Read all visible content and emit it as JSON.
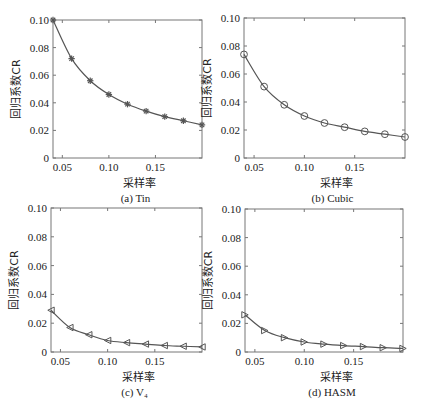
{
  "figure": {
    "panels": [
      {
        "id": "a",
        "caption": "(a) Tin",
        "box": {
          "x0": 53,
          "y0": 20,
          "x1": 202,
          "y1": 158
        },
        "marker": "star"
      },
      {
        "id": "b",
        "caption": "(b) Cubic",
        "box": {
          "x0": 244,
          "y0": 18,
          "x1": 405,
          "y1": 158
        },
        "marker": "circle"
      },
      {
        "id": "c",
        "caption": "(c) V₄",
        "box": {
          "x0": 51,
          "y0": 208,
          "x1": 202,
          "y1": 352
        },
        "marker": "triangle-left"
      },
      {
        "id": "d",
        "caption": "(d) HASM",
        "box": {
          "x0": 245,
          "y0": 209,
          "x1": 403,
          "y1": 352
        },
        "marker": "triangle-right"
      }
    ],
    "line_color": "#555555",
    "marker_color": "#555555"
  },
  "chart_data": [
    {
      "type": "line",
      "title": "(a) Tin",
      "xlabel": "采样率",
      "ylabel": "回归系数CR",
      "x": [
        0.04,
        0.06,
        0.08,
        0.1,
        0.12,
        0.14,
        0.16,
        0.18,
        0.2
      ],
      "series": [
        {
          "name": "Tin",
          "marker": "star",
          "values": [
            0.1,
            0.072,
            0.056,
            0.046,
            0.039,
            0.034,
            0.03,
            0.027,
            0.024
          ]
        }
      ],
      "xlim": [
        0.04,
        0.2
      ],
      "ylim": [
        0,
        0.1
      ],
      "xticks": [
        "0.05",
        "0.10",
        "0.15"
      ],
      "yticks": [
        "0",
        "0.02",
        "0.04",
        "0.06",
        "0.08",
        "0.10"
      ],
      "grid": false,
      "legend": null
    },
    {
      "type": "line",
      "title": "(b) Cubic",
      "xlabel": "采样率",
      "ylabel": "回归系数CR",
      "x": [
        0.04,
        0.06,
        0.08,
        0.1,
        0.12,
        0.14,
        0.16,
        0.18,
        0.2
      ],
      "series": [
        {
          "name": "Cubic",
          "marker": "circle",
          "values": [
            0.074,
            0.051,
            0.038,
            0.03,
            0.025,
            0.022,
            0.019,
            0.017,
            0.015
          ]
        }
      ],
      "xlim": [
        0.04,
        0.2
      ],
      "ylim": [
        0,
        0.1
      ],
      "xticks": [
        "0.05",
        "0.10",
        "0.15"
      ],
      "yticks": [
        "0",
        "0.02",
        "0.04",
        "0.06",
        "0.08",
        "0.10"
      ],
      "grid": false,
      "legend": null
    },
    {
      "type": "line",
      "title": "(c) V₄",
      "xlabel": "采样率",
      "ylabel": "回归系数CR",
      "x": [
        0.04,
        0.06,
        0.08,
        0.1,
        0.12,
        0.14,
        0.16,
        0.18,
        0.2
      ],
      "series": [
        {
          "name": "V4",
          "marker": "triangle-left",
          "values": [
            0.029,
            0.017,
            0.012,
            0.008,
            0.0065,
            0.0055,
            0.0045,
            0.004,
            0.0035
          ]
        }
      ],
      "xlim": [
        0.04,
        0.2
      ],
      "ylim": [
        0,
        0.1
      ],
      "xticks": [
        "0.05",
        "0.10",
        "0.15"
      ],
      "yticks": [
        "0",
        "0.02",
        "0.04",
        "0.06",
        "0.08",
        "0.10"
      ],
      "grid": false,
      "legend": null
    },
    {
      "type": "line",
      "title": "(d) HASM",
      "xlabel": "采样率",
      "ylabel": "回归系数CR",
      "x": [
        0.04,
        0.06,
        0.08,
        0.1,
        0.12,
        0.14,
        0.16,
        0.18,
        0.2
      ],
      "series": [
        {
          "name": "HASM",
          "marker": "triangle-right",
          "values": [
            0.026,
            0.015,
            0.01,
            0.007,
            0.0055,
            0.0045,
            0.0038,
            0.003,
            0.0025
          ]
        }
      ],
      "xlim": [
        0.04,
        0.2
      ],
      "ylim": [
        0,
        0.1
      ],
      "xticks": [
        "0.05",
        "0.10",
        "0.15"
      ],
      "yticks": [
        "0",
        "0.02",
        "0.04",
        "0.06",
        "0.08",
        "0.10"
      ],
      "grid": false,
      "legend": null
    }
  ]
}
